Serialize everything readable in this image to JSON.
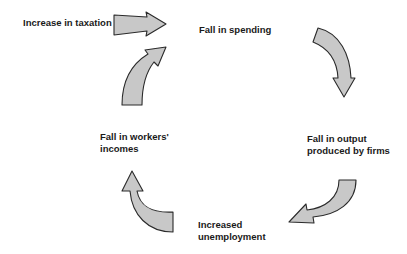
{
  "diagram": {
    "type": "cycle",
    "colors": {
      "arrow_fill": "#c8c8c8",
      "arrow_stroke": "#2a2a2a",
      "text": "#1a1a1a",
      "background": "#ffffff"
    },
    "input": {
      "label": "Increase in taxation"
    },
    "nodes": [
      {
        "id": "spending",
        "label": "Fall in spending"
      },
      {
        "id": "output",
        "line1": "Fall in output",
        "line2": "produced by firms"
      },
      {
        "id": "unemployment",
        "line1": "Increased",
        "line2": "unemployment"
      },
      {
        "id": "incomes",
        "line1": "Fall in workers'",
        "line2": "incomes"
      }
    ],
    "arrows": [
      {
        "from": "Increase in taxation",
        "to": "Fall in spending",
        "icon": "straight-arrow-right"
      },
      {
        "from": "Fall in spending",
        "to": "Fall in output produced by firms",
        "icon": "curved-arrow-down"
      },
      {
        "from": "Fall in output produced by firms",
        "to": "Increased unemployment",
        "icon": "curved-arrow-left"
      },
      {
        "from": "Increased unemployment",
        "to": "Fall in workers' incomes",
        "icon": "curved-arrow-up"
      },
      {
        "from": "Fall in workers' incomes",
        "to": "Fall in spending",
        "icon": "curved-arrow-right"
      }
    ]
  }
}
